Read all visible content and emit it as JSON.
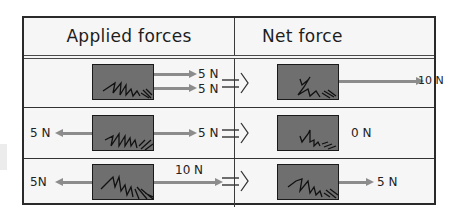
{
  "table": {
    "headers": {
      "applied": "Applied forces",
      "net": "Net force"
    },
    "rows": [
      {
        "applied_labels": [
          "5 N",
          "5 N"
        ],
        "net_label": "10 N"
      },
      {
        "applied_left_label": "5 N",
        "applied_right_label": "5 N",
        "net_label": "0 N"
      },
      {
        "applied_left_label": "5N",
        "applied_right_label": "10 N",
        "net_label": "5 N"
      }
    ]
  },
  "colors": {
    "border": "#2a2a2a",
    "box_fill": "#6f6f6f",
    "arrow": "#8c8c8c",
    "background": "#f6f6f6"
  },
  "icons": {
    "implies": "double-arrow-implies-icon",
    "force_arrow": "force-arrow-icon",
    "block": "block-with-scribble"
  }
}
